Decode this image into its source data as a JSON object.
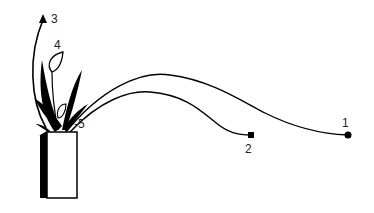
{
  "figure": {
    "labels": [
      {
        "id": "1",
        "text": "1",
        "x": 342,
        "y": 118
      },
      {
        "id": "2",
        "text": "2",
        "x": 245,
        "y": 143
      },
      {
        "id": "3",
        "text": "3",
        "x": 51,
        "y": 13
      },
      {
        "id": "4",
        "text": "4",
        "x": 54,
        "y": 40
      },
      {
        "id": "5",
        "text": "-5",
        "x": 76,
        "y": 119
      }
    ],
    "markers": [
      {
        "id": "1",
        "shape": "circle",
        "x": 348,
        "y": 135
      },
      {
        "id": "2",
        "shape": "square",
        "x": 251,
        "y": 135
      }
    ],
    "colors": {
      "ink": "#000000",
      "background": "#ffffff"
    }
  }
}
